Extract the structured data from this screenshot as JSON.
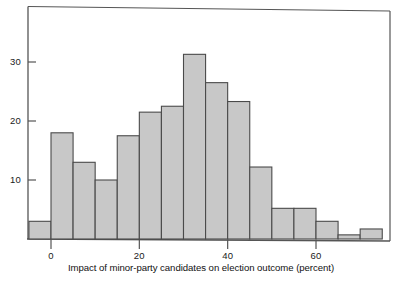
{
  "figure": {
    "cutoff_title": "",
    "frame_color": "#555555",
    "bar_fill": "#c8c8c8",
    "bar_edge": "#4a4a4a"
  },
  "axes": {
    "x_label": "Impact of minor-party candidates on election outcome (percent)",
    "y_label": "",
    "x_ticks": [
      "0",
      "20",
      "40",
      "60"
    ],
    "y_ticks": [
      "10",
      "20",
      "30"
    ]
  },
  "chart_data": {
    "type": "bar",
    "title": "",
    "subtitle": "",
    "xlabel": "Impact of minor-party candidates on election outcome (percent)",
    "ylabel": "",
    "grid": false,
    "legend": null,
    "xlim": [
      -5,
      80
    ],
    "ylim": [
      0,
      38
    ],
    "x_tick_values": [
      0,
      20,
      40,
      60
    ],
    "y_tick_values": [
      10,
      20,
      30
    ],
    "bin_width": 5,
    "bin_edges": [
      -5,
      0,
      5,
      10,
      15,
      20,
      25,
      30,
      35,
      40,
      45,
      50,
      55,
      60,
      65,
      70,
      75,
      80
    ],
    "categories": [
      "-5 to 0",
      "0 to 5",
      "5 to 10",
      "10 to 15",
      "15 to 20",
      "20 to 25",
      "25 to 30",
      "30 to 35",
      "35 to 40",
      "40 to 45",
      "45 to 50",
      "50 to 55",
      "55 to 60",
      "60 to 65",
      "65 to 70",
      "70 to 75",
      "75 to 80"
    ],
    "values": [
      3,
      18,
      13,
      10,
      17.5,
      21.5,
      22.5,
      31.3,
      26.5,
      23.3,
      12.2,
      5.2,
      5.2,
      3,
      0.7,
      1.7,
      0
    ]
  }
}
